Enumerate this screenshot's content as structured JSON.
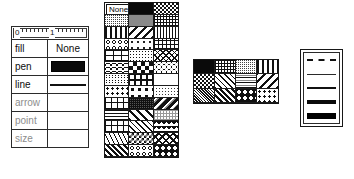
{
  "inspector": {
    "ruler": {
      "zero_label": "0",
      "one_label": "1",
      "name": "measurement-ruler"
    },
    "rows": [
      {
        "label": "fill",
        "value_text": "None",
        "value_kind": "text",
        "pattern": "",
        "disabled": false
      },
      {
        "label": "pen",
        "value_text": "",
        "value_kind": "solid",
        "pattern": "pt-solid",
        "disabled": false
      },
      {
        "label": "line",
        "value_text": "",
        "value_kind": "line",
        "pattern": "",
        "disabled": false
      },
      {
        "label": "arrow",
        "value_text": "",
        "value_kind": "empty",
        "pattern": "",
        "disabled": true
      },
      {
        "label": "point",
        "value_text": "",
        "value_kind": "empty",
        "pattern": "",
        "disabled": true
      },
      {
        "label": "size",
        "value_text": "",
        "value_kind": "empty",
        "pattern": "",
        "disabled": true
      }
    ]
  },
  "fill_palette": {
    "none_label": "None",
    "columns": 3,
    "rows": 11,
    "cells": [
      {
        "pattern": "pt-empty",
        "selected": true,
        "label": "none"
      },
      {
        "pattern": "pt-solid",
        "selected": false,
        "label": "solid-black"
      },
      {
        "pattern": "pt-checker",
        "selected": false,
        "label": "checker-dense"
      },
      {
        "pattern": "pt-gray25",
        "selected": false,
        "label": "gray-25"
      },
      {
        "pattern": "pt-midgray",
        "selected": false,
        "label": "gray-50-flat"
      },
      {
        "pattern": "pt-grid-fine",
        "selected": false,
        "label": "fine-grid"
      },
      {
        "pattern": "pt-vline-wide",
        "selected": false,
        "label": "vertical-bars"
      },
      {
        "pattern": "pt-diag-l-bold",
        "selected": false,
        "label": "diagonal-left-bold"
      },
      {
        "pattern": "pt-vline",
        "selected": false,
        "label": "vertical-lines"
      },
      {
        "pattern": "pt-rings",
        "selected": false,
        "label": "rings"
      },
      {
        "pattern": "pt-sparse",
        "selected": false,
        "label": "sparse-dots"
      },
      {
        "pattern": "pt-grid",
        "selected": false,
        "label": "grid"
      },
      {
        "pattern": "pt-brick",
        "selected": false,
        "label": "brick"
      },
      {
        "pattern": "pt-dots-fine",
        "selected": false,
        "label": "fine-dots"
      },
      {
        "pattern": "pt-crosshatch",
        "selected": false,
        "label": "crosshatch"
      },
      {
        "pattern": "pt-scale",
        "selected": false,
        "label": "fish-scale"
      },
      {
        "pattern": "pt-checker-big",
        "selected": false,
        "label": "checker-large"
      },
      {
        "pattern": "pt-bubbles",
        "selected": false,
        "label": "bubbles"
      },
      {
        "pattern": "pt-wave",
        "selected": false,
        "label": "wave"
      },
      {
        "pattern": "pt-boxes",
        "selected": false,
        "label": "boxes"
      },
      {
        "pattern": "pt-empty",
        "selected": false,
        "label": "white"
      },
      {
        "pattern": "pt-dots",
        "selected": false,
        "label": "dots"
      },
      {
        "pattern": "pt-dots-big",
        "selected": false,
        "label": "large-dots"
      },
      {
        "pattern": "pt-gray12",
        "selected": false,
        "label": "gray-12"
      },
      {
        "pattern": "pt-grid-coarse",
        "selected": false,
        "label": "coarse-grid"
      },
      {
        "pattern": "pt-gray75",
        "selected": false,
        "label": "gray-75"
      },
      {
        "pattern": "pt-darkdiag",
        "selected": false,
        "label": "dark-diagonal"
      },
      {
        "pattern": "pt-hline",
        "selected": false,
        "label": "horizontal-lines"
      },
      {
        "pattern": "pt-diag-r-bold",
        "selected": false,
        "label": "diagonal-right-bold"
      },
      {
        "pattern": "pt-lightgrid",
        "selected": false,
        "label": "light-grid"
      },
      {
        "pattern": "pt-plus",
        "selected": false,
        "label": "plus-grid"
      },
      {
        "pattern": "pt-diag-r",
        "selected": false,
        "label": "diagonal-right"
      },
      {
        "pattern": "pt-triangles",
        "selected": false,
        "label": "triangles"
      },
      {
        "pattern": "pt-thatch",
        "selected": false,
        "label": "thatch"
      },
      {
        "pattern": "pt-zigzag",
        "selected": false,
        "label": "zigzag"
      },
      {
        "pattern": "pt-crosshatch-bold",
        "selected": false,
        "label": "crosshatch-bold"
      },
      {
        "pattern": "pt-houndstooth",
        "selected": false,
        "label": "houndstooth"
      },
      {
        "pattern": "pt-rings",
        "selected": false,
        "label": "rings-2"
      },
      {
        "pattern": "pt-stars",
        "selected": false,
        "label": "stars"
      }
    ]
  },
  "pen_palette": {
    "columns": 4,
    "rows": 3,
    "cells": [
      {
        "pattern": "pt-solid",
        "selected": false,
        "label": "solid-black"
      },
      {
        "pattern": "pt-grid-fine",
        "selected": false,
        "label": "fine-grid"
      },
      {
        "pattern": "pt-gray25",
        "selected": false,
        "label": "gray-25"
      },
      {
        "pattern": "pt-vline-wide",
        "selected": false,
        "label": "vertical-bars"
      },
      {
        "pattern": "pt-checker",
        "selected": false,
        "label": "checker-dense"
      },
      {
        "pattern": "pt-diag-r",
        "selected": false,
        "label": "diagonal-right"
      },
      {
        "pattern": "pt-band",
        "selected": false,
        "label": "banded-gray"
      },
      {
        "pattern": "pt-diag-l-bold",
        "selected": false,
        "label": "diagonal-left-bold"
      },
      {
        "pattern": "pt-gray50",
        "selected": false,
        "label": "gray-50"
      },
      {
        "pattern": "pt-houndstooth",
        "selected": false,
        "label": "houndstooth"
      },
      {
        "pattern": "pt-stars",
        "selected": false,
        "label": "stars"
      },
      {
        "pattern": "pt-dots",
        "selected": false,
        "label": "dots"
      }
    ]
  },
  "line_palette": {
    "rows": [
      {
        "style": "w-dash",
        "label": "dashed-hairline",
        "selected": false
      },
      {
        "style": "w1",
        "label": "width-1",
        "selected": false
      },
      {
        "style": "w2",
        "label": "width-2",
        "selected": false
      },
      {
        "style": "w3",
        "label": "width-4",
        "selected": false
      },
      {
        "style": "w4",
        "label": "width-6",
        "selected": false
      }
    ]
  },
  "colors": {
    "background": "#ffffff",
    "ink": "#111111",
    "border": "#1a1a1a",
    "disabled_text": "#8d8d8d"
  }
}
